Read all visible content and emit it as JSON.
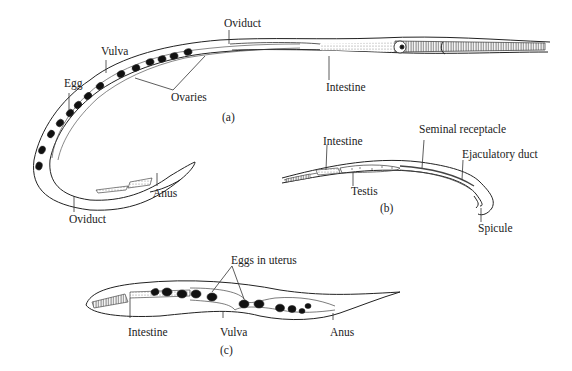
{
  "figure": {
    "panels": [
      {
        "id": "a",
        "caption": "(a)",
        "description": "Female nematode",
        "labels": {
          "oviduct_top": "Oviduct",
          "vulva": "Vulva",
          "egg": "Egg",
          "ovaries": "Ovaries",
          "intestine": "Intestine",
          "anus": "Anus",
          "oviduct_bottom": "Oviduct"
        }
      },
      {
        "id": "b",
        "caption": "(b)",
        "description": "Male nematode",
        "labels": {
          "intestine": "Intestine",
          "seminal_receptacle": "Seminal receptacle",
          "ejaculatory_duct": "Ejaculatory duct",
          "testis": "Testis",
          "spicule": "Spicule"
        }
      },
      {
        "id": "c",
        "caption": "(c)",
        "description": "Gravid female nematode",
        "labels": {
          "eggs_in_uterus": "Eggs in uterus",
          "intestine": "Intestine",
          "vulva": "Vulva",
          "anus": "Anus"
        }
      }
    ],
    "colors": {
      "line": "#222222",
      "egg_fill": "#111111",
      "background": "#ffffff",
      "stipple": "#9a9a9a"
    }
  }
}
